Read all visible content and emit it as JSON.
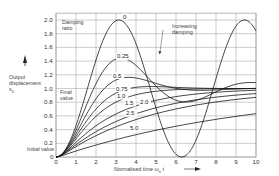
{
  "chart_data": {
    "type": "line",
    "title": "",
    "xlabel": "Normalised time ωn t",
    "ylabel": "Output displacement x0",
    "xlim": [
      0,
      10
    ],
    "ylim": [
      0,
      2.1
    ],
    "x_ticks": [
      "0",
      "1",
      "2",
      "3",
      "4",
      "5",
      "6",
      "7",
      "8",
      "9",
      "10"
    ],
    "y_ticks": [
      "0",
      "0.2",
      "0.4",
      "0.6",
      "0.8",
      "1.0",
      "1.2",
      "1.4",
      "1.6",
      "1.8",
      "2.0"
    ],
    "grid": true,
    "legend_title": "Damping ratio",
    "annotations": [
      "Damping ratio",
      "Increasing damping",
      "Final value",
      "Initial value"
    ],
    "series": [
      {
        "name": "0",
        "label": "0",
        "zeta": 0,
        "x": [
          0,
          1,
          2,
          3,
          3.14,
          4,
          5,
          6,
          6.28,
          7,
          8,
          9,
          9.42,
          10
        ],
        "values": [
          0,
          0.46,
          1.42,
          1.99,
          2.0,
          1.65,
          0.72,
          0.04,
          0,
          0.25,
          1.15,
          1.91,
          2.0,
          1.84
        ]
      },
      {
        "name": "0.25",
        "label": "0.25",
        "zeta": 0.25,
        "x": [
          0,
          1,
          2,
          3,
          3.24,
          4,
          5,
          6,
          7,
          8,
          9,
          10
        ],
        "values": [
          0,
          0.43,
          1.19,
          1.43,
          1.44,
          1.28,
          0.96,
          0.79,
          0.85,
          1.02,
          1.13,
          1.11
        ]
      },
      {
        "name": "0.5",
        "label": "0.5",
        "zeta": 0.5,
        "x": [
          0,
          1,
          2,
          3,
          3.63,
          4,
          5,
          6,
          7,
          8,
          9,
          10
        ],
        "values": [
          0,
          0.38,
          0.93,
          1.13,
          1.16,
          1.15,
          1.06,
          0.99,
          0.98,
          0.99,
          1.0,
          1.0
        ]
      },
      {
        "name": "0.75",
        "label": "0.75",
        "zeta": 0.75,
        "x": [
          0,
          1,
          2,
          3,
          4,
          5,
          6,
          7,
          8,
          9,
          10
        ],
        "values": [
          0,
          0.34,
          0.76,
          0.97,
          1.03,
          1.03,
          1.02,
          1.01,
          1.0,
          1.0,
          1.0
        ]
      },
      {
        "name": "1.0",
        "label": "1.0",
        "zeta": 1.0,
        "x": [
          0,
          1,
          2,
          3,
          4,
          5,
          6,
          7,
          8,
          9,
          10
        ],
        "values": [
          0,
          0.26,
          0.59,
          0.8,
          0.91,
          0.96,
          0.98,
          0.99,
          1.0,
          1.0,
          1.0
        ]
      },
      {
        "name": "1.5",
        "label": "1.5",
        "zeta": 1.5,
        "x": [
          0,
          1,
          2,
          3,
          4,
          5,
          6,
          7,
          8,
          9,
          10
        ],
        "values": [
          0,
          0.19,
          0.43,
          0.61,
          0.73,
          0.82,
          0.88,
          0.92,
          0.94,
          0.96,
          0.97
        ]
      },
      {
        "name": "2.0",
        "label": "2.0",
        "zeta": 2.0,
        "x": [
          0,
          1,
          2,
          3,
          4,
          5,
          6,
          7,
          8,
          9,
          10
        ],
        "values": [
          0,
          0.15,
          0.34,
          0.5,
          0.62,
          0.72,
          0.79,
          0.85,
          0.89,
          0.92,
          0.94
        ]
      },
      {
        "name": "2.5",
        "label": "2.5",
        "zeta": 2.5,
        "x": [
          0,
          1,
          2,
          3,
          4,
          5,
          6,
          7,
          8,
          9,
          10
        ],
        "values": [
          0,
          0.12,
          0.28,
          0.42,
          0.53,
          0.63,
          0.7,
          0.76,
          0.81,
          0.85,
          0.88
        ]
      },
      {
        "name": "5.0",
        "label": "5.0",
        "zeta": 5.0,
        "x": [
          0,
          1,
          2,
          3,
          4,
          5,
          6,
          7,
          8,
          9,
          10
        ],
        "values": [
          0,
          0.07,
          0.16,
          0.25,
          0.33,
          0.39,
          0.45,
          0.51,
          0.55,
          0.6,
          0.63
        ]
      }
    ]
  },
  "labels": {
    "damping_ratio": [
      "Damping",
      "ratio"
    ],
    "increasing_damping": [
      "Increasing",
      "damping"
    ],
    "final_value": [
      "Final",
      "value"
    ],
    "initial_value": "Initial value",
    "y_axis": [
      "Output",
      "displacement",
      "x"
    ],
    "y_axis_sub": "0",
    "x_axis": "Normalised time ω",
    "x_axis_sub": "n",
    "x_axis_tail": " t"
  },
  "colors": {
    "curve": "#1a1a1a",
    "grid": "#9a9a9a",
    "text": "#333333"
  }
}
